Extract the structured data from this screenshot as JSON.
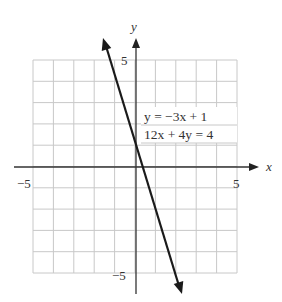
{
  "chart_data": {
    "type": "line",
    "title": "",
    "xlabel": "x",
    "ylabel": "y",
    "xlim": [
      -5,
      5
    ],
    "ylim": [
      -5,
      5
    ],
    "grid": true,
    "grid_step": 1,
    "x_tick_labels": [
      "-5",
      "5"
    ],
    "y_tick_labels": [
      "5",
      "-5"
    ],
    "series": [
      {
        "name": "y = -3x + 1",
        "equation_slope_intercept": "y = −3x + 1",
        "equation_standard": "12x + 4y = 4",
        "slope": -3,
        "intercept": 1,
        "x": [
          -2,
          -1,
          0,
          1,
          2
        ],
        "y": [
          7,
          4,
          1,
          -2,
          -5
        ]
      }
    ],
    "annotations": [
      "y = −3x + 1",
      "12x + 4y = 4"
    ],
    "legend_position": "upper right (inside grid)"
  },
  "labels": {
    "x_axis": "x",
    "y_axis": "y",
    "x_min": "−5",
    "x_max": "5",
    "y_max": "5",
    "y_min": "−5",
    "eq1": "y = −3x + 1",
    "eq2": "12x + 4y = 4"
  },
  "colors": {
    "grid": "#c8c8c8",
    "axis": "#333333",
    "line": "#1a1a1a",
    "text": "#333333"
  }
}
